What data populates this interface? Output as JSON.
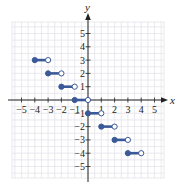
{
  "chart_data": {
    "type": "line",
    "title": "",
    "subtitle": "",
    "xlabel": "x",
    "ylabel": "y",
    "xlim": [
      -5.7,
      5.7
    ],
    "ylim": [
      -5.7,
      5.7
    ],
    "grid": true,
    "legend": null,
    "x_ticks": [
      -5,
      -4,
      -3,
      -2,
      -1,
      1,
      2,
      3,
      4,
      5
    ],
    "y_ticks": [
      5,
      4,
      3,
      2,
      1,
      -1,
      -2,
      -3,
      -4,
      -5
    ],
    "x_tick_labels": [
      "−5",
      "−4",
      "−3",
      "−2",
      "−1",
      "1",
      "2",
      "3",
      "4",
      "5"
    ],
    "y_tick_labels": [
      "5",
      "4",
      "3",
      "2",
      "1",
      "−1",
      "−2",
      "−3",
      "−4",
      "−5"
    ],
    "series": [
      {
        "name": "step segments",
        "color": "#3b5998",
        "segments": [
          {
            "x_start": -4,
            "x_end": -3,
            "y": 3,
            "start_closed": true,
            "end_closed": false
          },
          {
            "x_start": -3,
            "x_end": -2,
            "y": 2,
            "start_closed": true,
            "end_closed": false
          },
          {
            "x_start": -2,
            "x_end": -1,
            "y": 1,
            "start_closed": true,
            "end_closed": false
          },
          {
            "x_start": -1,
            "x_end": 0,
            "y": 0,
            "start_closed": true,
            "end_closed": false
          },
          {
            "x_start": 0,
            "x_end": 1,
            "y": -1,
            "start_closed": true,
            "end_closed": false
          },
          {
            "x_start": 1,
            "x_end": 2,
            "y": -2,
            "start_closed": true,
            "end_closed": false
          },
          {
            "x_start": 2,
            "x_end": 3,
            "y": -3,
            "start_closed": true,
            "end_closed": false
          },
          {
            "x_start": 3,
            "x_end": 4,
            "y": -4,
            "start_closed": true,
            "end_closed": false
          }
        ]
      }
    ]
  },
  "colors": {
    "grid": "#e3e3ea",
    "axis": "#222222",
    "series": "#3b5998"
  }
}
